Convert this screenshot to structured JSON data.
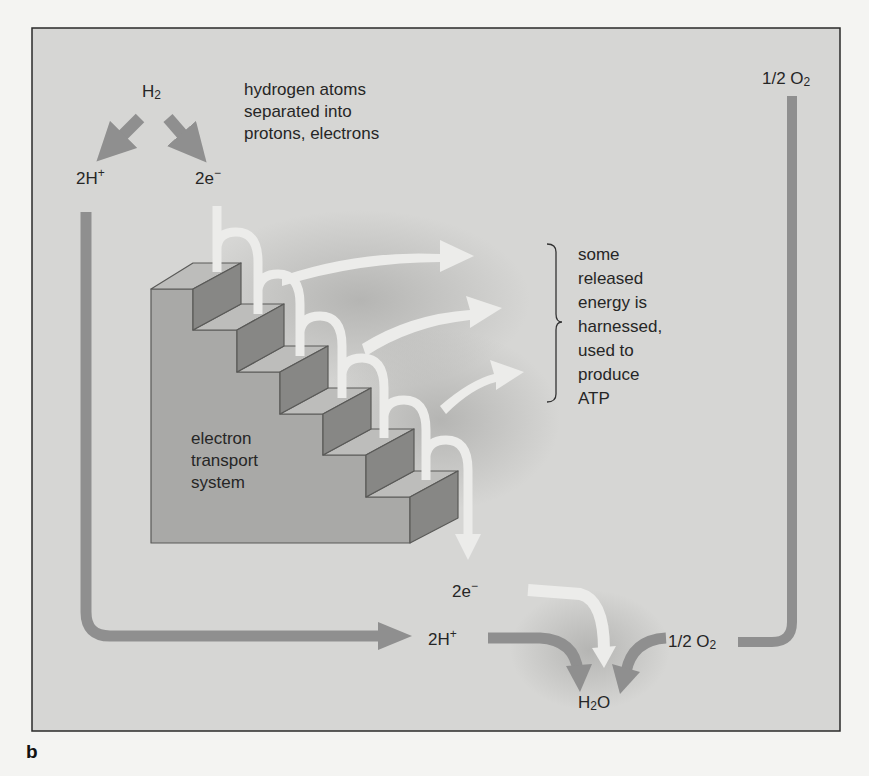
{
  "figure": {
    "panel_letter": "b",
    "colors": {
      "page_background": "#f4f4f2",
      "panel_background": "#d6d6d4",
      "panel_border": "#2a2a2a",
      "proton_oxygen_path": "#8f8f8f",
      "electron_path": "#ececea",
      "stair_body": "#a9a9a7",
      "stair_tread": "#bdbdbb",
      "stair_riser": "#878785",
      "text": "#262626"
    }
  },
  "labels": {
    "h2": {
      "base": "H",
      "sub": "2"
    },
    "split_note": [
      "hydrogen atoms",
      "separated into",
      "protons, electrons"
    ],
    "protons_top": {
      "base": "2H",
      "sup": "+"
    },
    "electrons_top": {
      "base": "2e",
      "sup": "−"
    },
    "half_o2_top": {
      "base": "1/2 O",
      "sub": "2"
    },
    "energy_note": [
      "some",
      "released",
      "energy is",
      "harnessed,",
      "used to",
      "produce",
      "ATP"
    ],
    "ets": [
      "electron",
      "transport",
      "system"
    ],
    "electrons_bottom": {
      "base": "2e",
      "sup": "−"
    },
    "protons_bottom": {
      "base": "2H",
      "sup": "+"
    },
    "half_o2_bottom": {
      "base": "1/2 O",
      "sub": "2"
    },
    "water": {
      "base": "H",
      "sub": "2",
      "tail": "O"
    }
  },
  "icons": {
    "proton_arrow": "gray-curved-arrow",
    "electron_arrow": "white-curved-arrow",
    "energy_arrow": "white-swoosh-arrow",
    "bracket": "right-curly-brace",
    "staircase": "3d-staircase"
  }
}
